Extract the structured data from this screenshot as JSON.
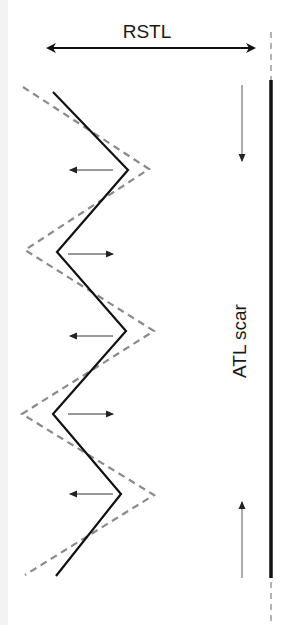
{
  "labels": {
    "top": "RSTL",
    "scar": "ATL scar"
  },
  "colors": {
    "solid": "#111111",
    "dashed": "#8a8a8a",
    "thin_arrow": "#555555",
    "background": "#ffffff"
  },
  "geometry": {
    "rstl_arrow": {
      "x1": 44,
      "x2": 258,
      "y": 48
    },
    "scar_line": {
      "x": 271,
      "solid_y1": 80,
      "solid_y2": 578,
      "dash_y1": 32,
      "dash_y2": 622
    },
    "solid_zigzag": "53,92 128,170 57,252 126,331 53,414 121,494 56,576",
    "dashed_zigzag": "23,87 149,169 25,250 154,331 22,414 154,495 25,575",
    "tension_arrows": [
      {
        "dir": "left",
        "y": 170
      },
      {
        "dir": "right",
        "y": 254
      },
      {
        "dir": "left",
        "y": 336
      },
      {
        "dir": "right",
        "y": 414
      },
      {
        "dir": "left",
        "y": 494
      }
    ],
    "side_arrows": [
      {
        "dir": "down",
        "x": 242,
        "y1": 85,
        "y2": 163
      },
      {
        "dir": "up",
        "x": 242,
        "y1": 578,
        "y2": 500
      }
    ]
  }
}
